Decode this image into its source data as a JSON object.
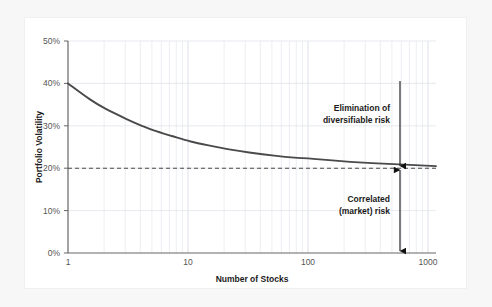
{
  "chart_data": {
    "type": "line",
    "title": "",
    "xlabel": "Number of Stocks",
    "ylabel": "Portfolio Volatility",
    "xscale": "log",
    "xlim": [
      1,
      1000
    ],
    "ylim": [
      0,
      0.5
    ],
    "grid": true,
    "legend_position": "none",
    "xticks": [
      "1",
      "10",
      "100",
      "1000"
    ],
    "xtick_values": [
      1,
      10,
      100,
      1000
    ],
    "yticks": [
      "0%",
      "10%",
      "20%",
      "30%",
      "40%",
      "50%"
    ],
    "ytick_values": [
      0,
      0.1,
      0.2,
      0.3,
      0.4,
      0.5
    ],
    "series": [
      {
        "name": "Portfolio volatility",
        "color": "#4a4a4a",
        "x": [
          1,
          1.5,
          2,
          3,
          4,
          5,
          7,
          10,
          15,
          20,
          30,
          50,
          70,
          100,
          200,
          300,
          500,
          1000
        ],
        "values": [
          0.4,
          0.363,
          0.341,
          0.316,
          0.3,
          0.289,
          0.276,
          0.263,
          0.252,
          0.245,
          0.237,
          0.229,
          0.225,
          0.222,
          0.215,
          0.212,
          0.209,
          0.205
        ]
      }
    ],
    "reference_lines": [
      {
        "name": "market-risk-asymptote",
        "value": 0.2,
        "label": "20%",
        "style": "dashed",
        "color": "#4a4a4a",
        "orientation": "horizontal"
      }
    ],
    "annotations": [
      {
        "name": "elimination-of-diversifiable-risk",
        "text_line1": "Elimination of",
        "text_line2": "diversifiable risk",
        "arrow": "double-ended-vertical",
        "from_value": 0.4,
        "to_value": 0.2,
        "at_x": 700
      },
      {
        "name": "correlated-market-risk",
        "text_line1": "Correlated",
        "text_line2": "(market) risk",
        "arrow": "double-ended-vertical",
        "from_value": 0.2,
        "to_value": 0.0,
        "at_x": 700
      }
    ]
  },
  "colors": {
    "page_background": "#f7f7f7",
    "card_background": "#ffffff",
    "curve": "#4a4a4a",
    "axis": "#666666",
    "grid": "#dfe3ea",
    "text": "#1a1a1a",
    "tick_text": "#555555"
  }
}
